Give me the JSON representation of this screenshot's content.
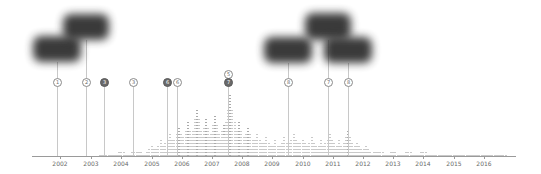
{
  "chart_data": {
    "type": "bar",
    "title": "",
    "xlabel": "",
    "ylabel": "",
    "grid": false,
    "x_ticks": [
      "2002",
      "2003",
      "2004",
      "2005",
      "2006",
      "2007",
      "2008",
      "2009",
      "2010",
      "2011",
      "2012",
      "2013",
      "2014",
      "2015",
      "2016"
    ],
    "x_range": [
      2001.1,
      2017.0
    ],
    "series": [
      {
        "name": "activity",
        "x": [
          2003.5,
          2004.0,
          2004.5,
          2005.0,
          2005.3,
          2005.6,
          2005.9,
          2006.2,
          2006.5,
          2006.8,
          2007.1,
          2007.4,
          2007.6,
          2007.9,
          2008.2,
          2008.5,
          2008.8,
          2009.1,
          2009.4,
          2009.7,
          2010.0,
          2010.3,
          2010.6,
          2010.9,
          2011.2,
          2011.5,
          2011.8,
          2012.1,
          2012.5,
          2013.0,
          2013.5,
          2014.0,
          2014.5,
          2015.0,
          2015.5,
          2016.0,
          2016.5
        ],
        "values": [
          2,
          3,
          4,
          6,
          10,
          14,
          18,
          22,
          30,
          24,
          26,
          20,
          38,
          22,
          18,
          14,
          12,
          10,
          12,
          14,
          11,
          12,
          10,
          14,
          10,
          16,
          8,
          6,
          4,
          3,
          3,
          3,
          2,
          2,
          2,
          1,
          1
        ]
      }
    ],
    "markers": [
      {
        "label": "1",
        "year": 2001.9,
        "filled": false
      },
      {
        "label": "2",
        "year": 2002.85,
        "filled": false
      },
      {
        "label": "3",
        "year": 2003.4,
        "filled": true
      },
      {
        "label": "3",
        "year": 2004.4,
        "filled": false
      },
      {
        "label": "6",
        "year": 2005.5,
        "filled": true
      },
      {
        "label": "6",
        "year": 2005.85,
        "filled": false
      },
      {
        "label": "5",
        "year": 2007.55,
        "filled": false,
        "stacked": true
      },
      {
        "label": "7",
        "year": 2007.55,
        "filled": true
      },
      {
        "label": "8",
        "year": 2009.5,
        "filled": false
      },
      {
        "label": "7",
        "year": 2010.85,
        "filled": false
      },
      {
        "label": "8",
        "year": 2011.6,
        "filled": false
      }
    ],
    "thumbnails": 5
  },
  "axis": {
    "ticks": [
      {
        "label": "2002",
        "x": 60
      },
      {
        "label": "2003",
        "x": 91
      },
      {
        "label": "2004",
        "x": 121
      },
      {
        "label": "2005",
        "x": 152
      },
      {
        "label": "2006",
        "x": 182
      },
      {
        "label": "2007",
        "x": 212
      },
      {
        "label": "2008",
        "x": 242
      },
      {
        "label": "2009",
        "x": 272
      },
      {
        "label": "2010",
        "x": 303
      },
      {
        "label": "2011",
        "x": 333
      },
      {
        "label": "2012",
        "x": 363
      },
      {
        "label": "2013",
        "x": 393
      },
      {
        "label": "2014",
        "x": 423
      },
      {
        "label": "2015",
        "x": 454
      },
      {
        "label": "2016",
        "x": 484
      }
    ]
  },
  "markers": [
    {
      "label": "1",
      "x": 57,
      "top": 78,
      "filled": false,
      "stem_top": 62
    },
    {
      "label": "2",
      "x": 86,
      "top": 78,
      "filled": false,
      "stem_top": 40
    },
    {
      "label": "3",
      "x": 104,
      "top": 78,
      "filled": true,
      "stem_top": 85
    },
    {
      "label": "3",
      "x": 133,
      "top": 78,
      "filled": false,
      "stem_top": 85
    },
    {
      "label": "6",
      "x": 167,
      "top": 78,
      "filled": true,
      "stem_top": 85
    },
    {
      "label": "6",
      "x": 177,
      "top": 78,
      "filled": false,
      "stem_top": 85
    },
    {
      "label": "5",
      "x": 228,
      "top": 70,
      "filled": false,
      "stem_top": 85
    },
    {
      "label": "7",
      "x": 228,
      "top": 78,
      "filled": true,
      "stem_top": 85
    },
    {
      "label": "8",
      "x": 288,
      "top": 78,
      "filled": false,
      "stem_top": 63
    },
    {
      "label": "7",
      "x": 328,
      "top": 78,
      "filled": false,
      "stem_top": 40
    },
    {
      "label": "8",
      "x": 348,
      "top": 78,
      "filled": false,
      "stem_top": 63
    }
  ],
  "thumbnails": [
    {
      "name": "thumbnail-1",
      "left": 33,
      "top": 36,
      "width": 48,
      "height": 26
    },
    {
      "name": "thumbnail-2",
      "left": 63,
      "top": 14,
      "width": 46,
      "height": 26
    },
    {
      "name": "thumbnail-3",
      "left": 264,
      "top": 37,
      "width": 48,
      "height": 26
    },
    {
      "name": "thumbnail-4",
      "left": 305,
      "top": 13,
      "width": 46,
      "height": 27
    },
    {
      "name": "thumbnail-5",
      "left": 324,
      "top": 37,
      "width": 48,
      "height": 26
    }
  ]
}
